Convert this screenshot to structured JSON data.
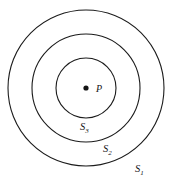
{
  "figure": {
    "background_color": "#ffffff",
    "stroke_color": "#1b1b1b",
    "dot_color": "#141414",
    "width": 174,
    "height": 183,
    "center": {
      "x": 86,
      "y": 88
    },
    "point": {
      "name": "point-p",
      "label": "P",
      "dot_radius": 2.6,
      "label_x": 96,
      "label_y": 92
    },
    "circles": [
      {
        "id": "s1",
        "label_base": "S",
        "label_sub": "1",
        "radius": 78,
        "label_x": 135,
        "label_y": 172,
        "description": "outer circle"
      },
      {
        "id": "s2",
        "label_base": "S",
        "label_sub": "2",
        "radius": 54,
        "label_x": 103,
        "label_y": 152,
        "description": "middle circle"
      },
      {
        "id": "s3",
        "label_base": "S",
        "label_sub": "3",
        "radius": 30,
        "label_x": 80,
        "label_y": 130,
        "description": "inner circle"
      }
    ]
  }
}
